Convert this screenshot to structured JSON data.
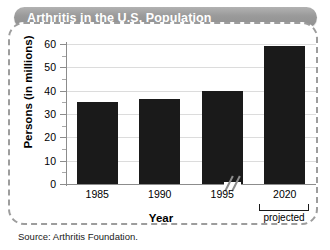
{
  "title": "Arthritis in the U.S. Population",
  "source": "Source: Arthritis Foundation.",
  "annotations": {
    "projected_label": "projected",
    "axis_break": "axis-break-slashes"
  },
  "chart_data": {
    "type": "bar",
    "title": "Arthritis in the U.S. Population",
    "categories": [
      "1985",
      "1990",
      "1995",
      "2020"
    ],
    "values": [
      35,
      36.5,
      40,
      59
    ],
    "xlabel": "Year",
    "ylabel": "Persons (in millions)",
    "ylim": [
      0,
      60
    ],
    "ytick_step": 10,
    "yticks": [
      "0",
      "10",
      "20",
      "30",
      "40",
      "50",
      "60"
    ],
    "yminor_step": 5,
    "grid": true,
    "legend": "none",
    "bar_color": "#1a1a1a",
    "notes": [
      "2020 bar is a projected value",
      "x-axis has a break between 1995 and 2020"
    ]
  }
}
